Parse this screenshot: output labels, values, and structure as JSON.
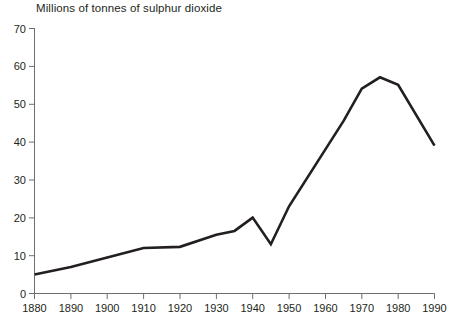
{
  "chart_data": {
    "type": "line",
    "title": "Millions of tonnes of sulphur dioxide",
    "xlabel": "",
    "ylabel": "",
    "xlim": [
      1880,
      1990
    ],
    "ylim": [
      0,
      70
    ],
    "grid": false,
    "legend": "none",
    "x_ticks": [
      "1880",
      "1890",
      "1900",
      "1910",
      "1920",
      "1930",
      "1940",
      "1950",
      "1960",
      "1970",
      "1980",
      "1990"
    ],
    "y_ticks": [
      "0",
      "10",
      "20",
      "30",
      "40",
      "50",
      "60",
      "70"
    ],
    "series": [
      {
        "name": "Sulphur dioxide emissions",
        "color": "#231f20",
        "x": [
          1880,
          1890,
          1900,
          1910,
          1920,
          1930,
          1935,
          1940,
          1945,
          1950,
          1960,
          1965,
          1970,
          1975,
          1980,
          1990
        ],
        "values": [
          5,
          7,
          9.5,
          12,
          12.3,
          15.5,
          16.5,
          20,
          13,
          23,
          38,
          45.5,
          54,
          57,
          55,
          39
        ]
      }
    ]
  },
  "axes": {
    "y_axis_name": "y-axis",
    "x_axis_name": "x-axis"
  }
}
